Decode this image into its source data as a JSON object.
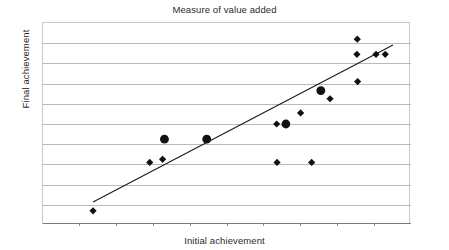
{
  "chart_data": {
    "type": "scatter",
    "title": "Measure of value added",
    "xlabel": "Initial achievement",
    "ylabel": "Final achievement",
    "grid": true,
    "legend": "none",
    "xlim": [
      0,
      100
    ],
    "ylim": [
      0,
      100
    ],
    "x_tick_labels": [],
    "y_tick_labels": [],
    "n_gridlines": 9,
    "series": [
      {
        "name": "schools (diamond)",
        "marker": "diamond",
        "color": "#111111",
        "points": [
          {
            "x": 13.6,
            "y": 7.0
          },
          {
            "x": 29.0,
            "y": 31.0
          },
          {
            "x": 32.5,
            "y": 32.5
          },
          {
            "x": 63.5,
            "y": 50.0
          },
          {
            "x": 63.6,
            "y": 31.0
          },
          {
            "x": 73.0,
            "y": 31.0
          },
          {
            "x": 70.0,
            "y": 55.5
          },
          {
            "x": 78.0,
            "y": 62.5
          },
          {
            "x": 85.5,
            "y": 71.0
          },
          {
            "x": 85.3,
            "y": 84.5
          },
          {
            "x": 90.5,
            "y": 84.5
          },
          {
            "x": 93.0,
            "y": 84.5
          },
          {
            "x": 85.4,
            "y": 92.0
          }
        ]
      },
      {
        "name": "schools (circle)",
        "marker": "circle",
        "color": "#111111",
        "points": [
          {
            "x": 33.0,
            "y": 42.5
          },
          {
            "x": 44.5,
            "y": 42.5
          },
          {
            "x": 66.0,
            "y": 50.0
          },
          {
            "x": 75.5,
            "y": 66.5
          }
        ]
      }
    ],
    "trendline": {
      "name": "line of best fit",
      "color": "#1a1a1a",
      "x0": 13.6,
      "y0": 11.4,
      "x1": 95.1,
      "y1": 89.1
    }
  }
}
